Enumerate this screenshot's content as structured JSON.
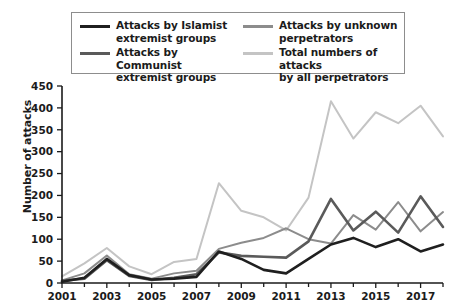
{
  "legend": {
    "items": [
      {
        "label": "Attacks by Islamist\nextremist groups",
        "color": "#1f1f1f",
        "key": "islamist"
      },
      {
        "label": "Attacks by unknown\nperpetrators",
        "color": "#8c8c8c",
        "key": "unknown"
      },
      {
        "label": "Attacks by Communist\nextremist groups",
        "color": "#5a5a5a",
        "key": "communist"
      },
      {
        "label": "Total numbers of attacks\nby all perpetrators",
        "color": "#c4c4c4",
        "key": "total"
      }
    ]
  },
  "chart_data": {
    "type": "line",
    "title": "",
    "xlabel": "",
    "ylabel": "Number of attacks",
    "ylim": [
      0,
      450
    ],
    "yticks": [
      0,
      50,
      100,
      150,
      200,
      250,
      300,
      350,
      400,
      450
    ],
    "xlim": [
      2001,
      2018
    ],
    "x": [
      2001,
      2002,
      2003,
      2004,
      2005,
      2006,
      2007,
      2008,
      2009,
      2010,
      2011,
      2012,
      2013,
      2014,
      2015,
      2016,
      2017,
      2018
    ],
    "xticks_major": [
      2001,
      2003,
      2005,
      2007,
      2009,
      2011,
      2013,
      2015,
      2017
    ],
    "xticks_minor": [
      2002,
      2004,
      2006,
      2008,
      2010,
      2012,
      2014,
      2016,
      2018
    ],
    "grid": false,
    "legend_position": "top",
    "series": [
      {
        "name": "Attacks by Islamist extremist groups",
        "key": "islamist",
        "color": "#1f1f1f",
        "width": 2.6,
        "values": [
          3,
          12,
          55,
          18,
          8,
          10,
          14,
          72,
          55,
          30,
          22,
          55,
          88,
          103,
          82,
          100,
          72,
          88
        ]
      },
      {
        "name": "Attacks by Communist extremist groups",
        "key": "communist",
        "color": "#5a5a5a",
        "width": 2.6,
        "values": [
          5,
          10,
          52,
          16,
          7,
          12,
          20,
          70,
          62,
          60,
          58,
          95,
          192,
          120,
          163,
          115,
          198,
          128
        ]
      },
      {
        "name": "Attacks by unknown perpetrators",
        "key": "unknown",
        "color": "#8c8c8c",
        "width": 2.0,
        "values": [
          6,
          22,
          63,
          20,
          10,
          22,
          28,
          78,
          92,
          103,
          125,
          100,
          90,
          155,
          122,
          185,
          118,
          162
        ]
      },
      {
        "name": "Total numbers of attacks by all perpetrators",
        "key": "total",
        "color": "#c4c4c4",
        "width": 2.0,
        "values": [
          15,
          45,
          80,
          38,
          20,
          48,
          55,
          228,
          165,
          150,
          120,
          195,
          415,
          330,
          390,
          365,
          405,
          335
        ]
      }
    ]
  }
}
